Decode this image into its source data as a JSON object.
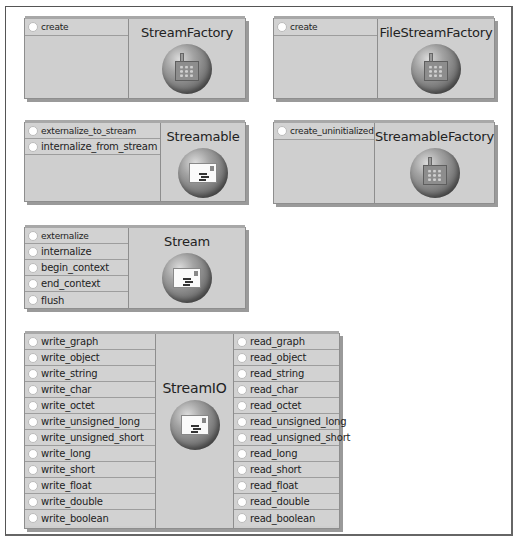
{
  "interfaces": {
    "stream_factory": {
      "name": "StreamFactory",
      "icon": "factory-icon",
      "operations": [
        "create"
      ]
    },
    "file_stream_factory": {
      "name": "FileStreamFactory",
      "icon": "factory-icon",
      "operations": [
        "create"
      ]
    },
    "streamable": {
      "name": "Streamable",
      "icon": "envelope-icon",
      "operations": [
        "externalize_to_stream",
        "internalize_from_stream"
      ]
    },
    "streamable_factory": {
      "name": "StreamableFactory",
      "icon": "factory-icon",
      "operations": [
        "create_uninitialized"
      ]
    },
    "stream": {
      "name": "Stream",
      "icon": "envelope-icon",
      "operations": [
        "externalize",
        "internalize",
        "begin_context",
        "end_context",
        "flush"
      ]
    },
    "stream_io": {
      "name": "StreamIO",
      "icon": "envelope-icon",
      "write_operations": [
        "write_graph",
        "write_object",
        "write_string",
        "write_char",
        "write_octet",
        "write_unsigned_long",
        "write_unsigned_short",
        "write_long",
        "write_short",
        "write_float",
        "write_double",
        "write_boolean"
      ],
      "read_operations": [
        "read_graph",
        "read_object",
        "read_string",
        "read_char",
        "read_octet",
        "read_unsigned_long",
        "read_unsigned_short",
        "read_long",
        "read_short",
        "read_float",
        "read_double",
        "read_boolean"
      ]
    }
  }
}
